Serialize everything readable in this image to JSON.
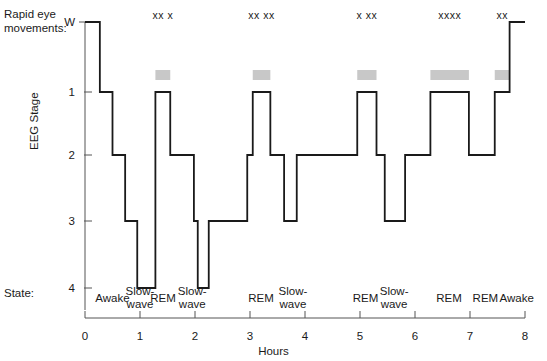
{
  "labels": {
    "rem_title": "Rapid eye\nmovements:",
    "y_axis_title": "EEG Stage",
    "x_axis_title": "Hours",
    "state_title": "State:"
  },
  "chart_data": {
    "type": "line",
    "title": "",
    "xlabel": "Hours",
    "ylabel": "EEG Stage",
    "xlim": [
      0,
      8
    ],
    "ylim": [
      0,
      4
    ],
    "grid": false,
    "legend": "none",
    "x_ticks": [
      "0",
      "1",
      "2",
      "3",
      "4",
      "5",
      "6",
      "7",
      "8"
    ],
    "y_ticks": [
      "W",
      "1",
      "2",
      "3",
      "4"
    ],
    "y_tick_values": [
      0,
      1,
      2,
      3,
      4
    ],
    "series": [
      {
        "name": "EEG sleep stage",
        "step": "post",
        "points": [
          {
            "hour": 0.0,
            "stage": "W"
          },
          {
            "hour": 0.27,
            "stage": "W"
          },
          {
            "hour": 0.27,
            "stage": "1"
          },
          {
            "hour": 0.5,
            "stage": "1"
          },
          {
            "hour": 0.5,
            "stage": "2"
          },
          {
            "hour": 0.73,
            "stage": "2"
          },
          {
            "hour": 0.73,
            "stage": "3"
          },
          {
            "hour": 0.95,
            "stage": "3"
          },
          {
            "hour": 0.95,
            "stage": "4"
          },
          {
            "hour": 1.28,
            "stage": "4"
          },
          {
            "hour": 1.28,
            "stage": "2"
          },
          {
            "hour": 1.28,
            "stage": "1"
          },
          {
            "hour": 1.55,
            "stage": "1"
          },
          {
            "hour": 1.55,
            "stage": "2"
          },
          {
            "hour": 1.98,
            "stage": "2"
          },
          {
            "hour": 1.98,
            "stage": "3"
          },
          {
            "hour": 2.05,
            "stage": "3"
          },
          {
            "hour": 2.05,
            "stage": "4"
          },
          {
            "hour": 2.25,
            "stage": "4"
          },
          {
            "hour": 2.25,
            "stage": "3"
          },
          {
            "hour": 2.95,
            "stage": "3"
          },
          {
            "hour": 2.95,
            "stage": "2"
          },
          {
            "hour": 3.05,
            "stage": "2"
          },
          {
            "hour": 3.05,
            "stage": "1"
          },
          {
            "hour": 3.37,
            "stage": "1"
          },
          {
            "hour": 3.37,
            "stage": "2"
          },
          {
            "hour": 3.62,
            "stage": "2"
          },
          {
            "hour": 3.62,
            "stage": "3"
          },
          {
            "hour": 3.85,
            "stage": "3"
          },
          {
            "hour": 3.85,
            "stage": "2"
          },
          {
            "hour": 4.95,
            "stage": "2"
          },
          {
            "hour": 4.95,
            "stage": "1"
          },
          {
            "hour": 5.3,
            "stage": "1"
          },
          {
            "hour": 5.3,
            "stage": "2"
          },
          {
            "hour": 5.45,
            "stage": "2"
          },
          {
            "hour": 5.45,
            "stage": "3"
          },
          {
            "hour": 5.82,
            "stage": "3"
          },
          {
            "hour": 5.82,
            "stage": "2"
          },
          {
            "hour": 6.28,
            "stage": "2"
          },
          {
            "hour": 6.28,
            "stage": "1"
          },
          {
            "hour": 6.98,
            "stage": "1"
          },
          {
            "hour": 6.98,
            "stage": "2"
          },
          {
            "hour": 7.45,
            "stage": "2"
          },
          {
            "hour": 7.45,
            "stage": "1"
          },
          {
            "hour": 7.72,
            "stage": "1"
          },
          {
            "hour": 7.72,
            "stage": "W"
          },
          {
            "hour": 8.0,
            "stage": "W"
          }
        ]
      }
    ],
    "rem_episodes": [
      {
        "label": "xx x",
        "start_hour": 1.28,
        "end_hour": 1.55
      },
      {
        "label": "xx xx",
        "start_hour": 3.05,
        "end_hour": 3.37
      },
      {
        "label": "x xx",
        "start_hour": 4.95,
        "end_hour": 5.3
      },
      {
        "label": "xxxx",
        "start_hour": 6.28,
        "end_hour": 6.98
      },
      {
        "label": "xx",
        "start_hour": 7.45,
        "end_hour": 7.72
      }
    ],
    "state_annotations": [
      {
        "label": "Awake",
        "hour": 0.5
      },
      {
        "label": "Slow-\nwave",
        "hour": 1.0
      },
      {
        "label": "REM",
        "hour": 1.42
      },
      {
        "label": "Slow-\nwave",
        "hour": 1.95
      },
      {
        "label": "REM",
        "hour": 3.2
      },
      {
        "label": "Slow-\nwave",
        "hour": 3.78
      },
      {
        "label": "REM",
        "hour": 5.1
      },
      {
        "label": "Slow-\nwave",
        "hour": 5.62
      },
      {
        "label": "REM",
        "hour": 6.62
      },
      {
        "label": "REM",
        "hour": 7.28
      },
      {
        "label": "Awake",
        "hour": 7.85
      }
    ],
    "colors": {
      "trace": "#1a1a1a",
      "rem_bar": "#c8c8c8",
      "axis": "#555555",
      "text": "#1a1a1a"
    }
  }
}
